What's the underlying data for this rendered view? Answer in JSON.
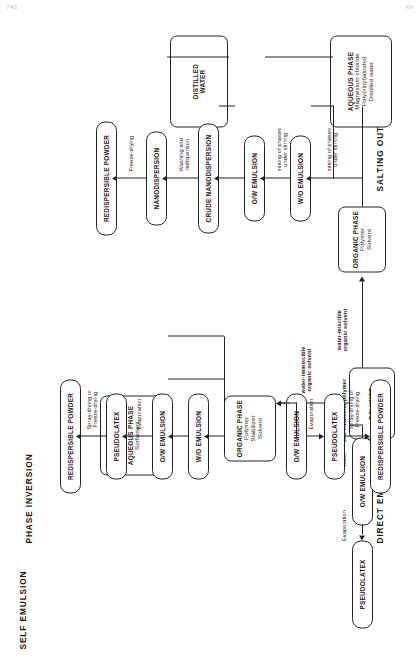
{
  "page": {
    "header_left": "740",
    "header_right": "Kh"
  },
  "figure": {
    "type": "flowchart",
    "orientation": "rotated-90-ccw",
    "branches": [
      {
        "id": "self-emulsion",
        "title": "SELF EMULSION",
        "nodes": [
          {
            "id": "polymer",
            "label": "POLYMER"
          },
          {
            "id": "ow-emulsion",
            "label": "O/W EMULSION"
          },
          {
            "id": "pseudolatex",
            "label": "PSEUDOLATEX"
          }
        ],
        "edges": [
          {
            "from": "polymer",
            "to": "ow-emulsion",
            "label": "Water",
            "label2": "self-emulsifier polymer"
          },
          {
            "from": "ow-emulsion",
            "to": "pseudolatex",
            "label": "Evaporation"
          }
        ]
      },
      {
        "id": "phase-inversion",
        "title": "PHASE INVERSION",
        "nodes": [
          {
            "id": "organic-phase",
            "label": "ORGANIC PHASE",
            "sub": [
              "Polymer",
              "Stabilizer",
              "Solvent"
            ]
          },
          {
            "id": "aqueous-phase",
            "label": "AQUEOUS PHASE",
            "sub": [
              "Surfactant"
            ]
          },
          {
            "id": "wo-emulsion",
            "label": "W/O EMULSION"
          },
          {
            "id": "ow-emulsion",
            "label": "O/W EMULSION"
          },
          {
            "id": "pseudolatex",
            "label": "PSEUDOLATEX"
          },
          {
            "id": "redispersible-powder",
            "label": "REDISPERSIBLE POWDER"
          }
        ],
        "edges": [
          {
            "from": "ow-emulsion",
            "to": "pseudolatex",
            "label": "Evaporation"
          },
          {
            "from": "pseudolatex",
            "to": "redispersible-powder",
            "label": "Spray-drying or",
            "label2": "Freeze-drying"
          }
        ]
      },
      {
        "id": "direct-emulsion",
        "title": "DIRECT EMULSION",
        "nodes": [
          {
            "id": "ow-emulsion",
            "label": "O/W EMULSION"
          },
          {
            "id": "pseudolatex",
            "label": "PSEUDOLATEX"
          },
          {
            "id": "redispersible-powder",
            "label": "REDISPERSIBLE POWDER"
          }
        ],
        "edges": [
          {
            "from": "ow-emulsion",
            "to": "pseudolatex",
            "label": "Evaporation"
          },
          {
            "from": "pseudolatex",
            "to": "redispersible-powder",
            "label": "Spray-drying or",
            "label2": "Freeze-drying"
          }
        ]
      },
      {
        "id": "salting-out",
        "title": "SALTING OUT",
        "nodes": [
          {
            "id": "organic-phase",
            "label": "ORGANIC PHASE",
            "sub": [
              "Polymer",
              "Solvent"
            ]
          },
          {
            "id": "aqueous-phase",
            "label": "AQUEOUS PHASE",
            "sub": [
              "Magnesium chloride",
              "Poly(vinyl)alcohol",
              "Distilled water"
            ]
          },
          {
            "id": "distilled-water",
            "label": "DISTILLED",
            "sub": [
              "WATER"
            ]
          },
          {
            "id": "wo-emulsion",
            "label": "W/O EMULSION"
          },
          {
            "id": "ow-emulsion",
            "label": "O/W EMULSION"
          },
          {
            "id": "crude-nanodispersion",
            "label": "CRUDE NANODISPERSION"
          },
          {
            "id": "nanodispersion",
            "label": "NANODISPERSION"
          },
          {
            "id": "redispersible-powder",
            "label": "REDISPERSIBLE POWDER"
          }
        ],
        "edges": [
          {
            "from": "organic-phase",
            "to": "wo-emulsion",
            "label": "mixing of phases",
            "label2": "under stirring"
          },
          {
            "from": "wo-emulsion",
            "to": "ow-emulsion",
            "label": "mixing of phases",
            "label2": "under stirring"
          },
          {
            "from": "crude-nanodispersion",
            "to": "nanodispersion",
            "label": "Washing and",
            "label2": "redispersion"
          },
          {
            "from": "nanodispersion",
            "to": "redispersible-powder",
            "label": "Freeze-drying"
          }
        ]
      }
    ],
    "shared_edges": [
      {
        "id": "polymer-to-organic",
        "label": "water-immiscible",
        "label2": "organic solvent"
      },
      {
        "id": "polymer-to-organic-salting",
        "label": "water-miscible",
        "label2": "organic solvent"
      }
    ]
  }
}
